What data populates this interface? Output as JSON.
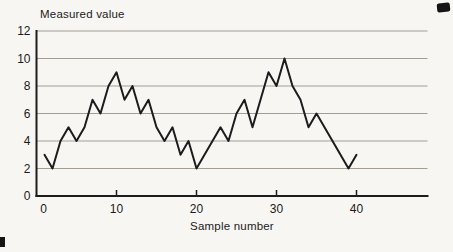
{
  "figure": {
    "background_color": "#f7f6f3",
    "line_color": "#1c1c1c",
    "grid_color": "#a39d94",
    "axis_color": "#1c1c1c",
    "text_color": "#1b1b1b"
  },
  "chart_data": {
    "type": "line",
    "title": "Measured value",
    "xlabel": "Sample number",
    "ylabel": "Measured value",
    "series_name": "Measured value",
    "x": [
      1,
      2,
      3,
      4,
      5,
      6,
      7,
      8,
      9,
      10,
      11,
      12,
      13,
      14,
      15,
      16,
      17,
      18,
      19,
      20,
      21,
      22,
      23,
      24,
      25,
      26,
      27,
      28,
      29,
      30,
      31,
      32,
      33,
      34,
      35,
      36,
      37,
      38,
      39,
      40
    ],
    "values": [
      3,
      2,
      4,
      5,
      4,
      5,
      7,
      6,
      8,
      9,
      7,
      8,
      6,
      7,
      5,
      4,
      5,
      3,
      4,
      2,
      3,
      4,
      5,
      4,
      6,
      7,
      5,
      7,
      9,
      8,
      10,
      8,
      7,
      5,
      6,
      5,
      4,
      3,
      2,
      3
    ],
    "xticks": [
      0,
      10,
      20,
      30,
      40
    ],
    "yticks": [
      0,
      2,
      4,
      6,
      8,
      10,
      12
    ],
    "xlim": [
      0,
      49
    ],
    "ylim": [
      0,
      12
    ],
    "grid": "horizontal",
    "legend": "none",
    "marker": "none"
  }
}
